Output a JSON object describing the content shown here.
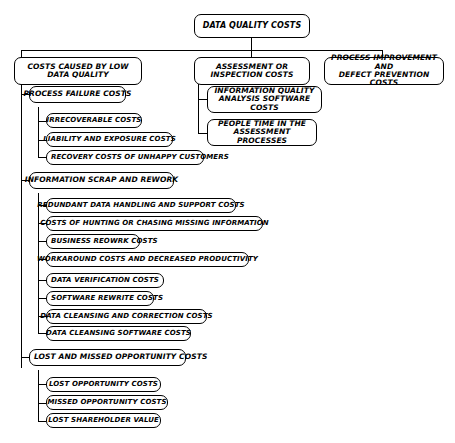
{
  "diagram": {
    "title": "DATA QUALITY COSTS",
    "root": {
      "label": "DATA QUALITY COSTS"
    },
    "branches": {
      "low_data_quality": {
        "label": "COSTS CAUSED BY LOW DATA QUALITY",
        "line1": "COSTS CAUSED BY LOW",
        "line2": "DATA QUALITY",
        "groups": [
          {
            "label": "PROCESS FAILURE COSTS",
            "items": [
              "IRRECOVERABLE COSTS",
              "LIABILITY AND EXPOSURE COSTS",
              "RECOVERY COSTS OF UNHAPPY CUSTOMERS"
            ]
          },
          {
            "label": "INFORMATION SCRAP AND REWORK",
            "items": [
              "REDUNDANT DATA HANDLING AND SUPPORT COSTS",
              "COSTS OF HUNTING OR CHASING MISSING INFORMATION",
              "BUSINESS REOWRK COSTS",
              "WORKAROUND COSTS AND DECREASED PRODUCTIVITY",
              "DATA VERIFICATION COSTS",
              "SOFTWARE REWRITE COSTS",
              "DATA CLEANSING AND CORRECTION COSTS",
              "DATA CLEANSING SOFTWARE COSTS"
            ]
          },
          {
            "label": "LOST AND MISSED OPPORTUNITY COSTS",
            "items": [
              "LOST OPPORTUNITY COSTS",
              "MISSED OPPORTUNITY COSTS",
              "LOST SHAREHOLDER VALUE"
            ]
          }
        ]
      },
      "assessment": {
        "label": "ASSESSMENT OR INSPECTION COSTS",
        "line1": "ASSESSMENT OR",
        "line2": "INSPECTION COSTS",
        "items": [
          {
            "line1": "INFORMATION QUALITY",
            "line2": "ANALYSIS SOFTWARE COSTS"
          },
          {
            "line1": "PEOPLE TIME IN THE",
            "line2": "ASSESSMENT PROCESSES"
          }
        ]
      },
      "process_improvement": {
        "label": "PROCESS IMPROVEMENT AND DEFECT PREVENTION COSTS",
        "line1": "PROCESS IMPROVEMENT AND",
        "line2": "DEFECT PREVENTION COSTS"
      }
    },
    "colors": {
      "line": "#000000",
      "box_fill": "#ffffff",
      "text": "#000000",
      "background": "#ffffff"
    }
  }
}
